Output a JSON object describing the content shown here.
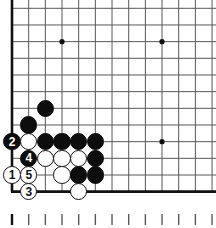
{
  "diagram": {
    "kind": "go-board-corner-diagram",
    "board": {
      "origin_x": 12,
      "origin_y": 8.3,
      "step": 16.67,
      "cols": 13,
      "rows": 12,
      "line_color": "#58585a",
      "edge_color": "#111111",
      "edge_width": 2.6,
      "line_width": 1.0,
      "background": "#ffffff",
      "edges": {
        "left": true,
        "bottom": true,
        "top": false,
        "right": false
      },
      "star_points": [
        {
          "col": 3,
          "row": 2
        },
        {
          "col": 9,
          "row": 2
        },
        {
          "col": 9,
          "row": 8
        }
      ],
      "star_radius": 2.6,
      "star_color": "#111111"
    },
    "stone_radius": 8.8,
    "stones": [
      {
        "id": "b-c2r6",
        "color": "black",
        "col": 2,
        "row": 6,
        "label": ""
      },
      {
        "id": "b-c1r7",
        "color": "black",
        "col": 1,
        "row": 7,
        "label": ""
      },
      {
        "id": "b-c0r8",
        "color": "black",
        "col": 0,
        "row": 8,
        "label": "2"
      },
      {
        "id": "w-c1r8",
        "color": "white",
        "col": 1,
        "row": 8,
        "label": ""
      },
      {
        "id": "b-c2r8",
        "color": "black",
        "col": 2,
        "row": 8,
        "label": ""
      },
      {
        "id": "b-c3r8",
        "color": "black",
        "col": 3,
        "row": 8,
        "label": ""
      },
      {
        "id": "b-c4r8",
        "color": "black",
        "col": 4,
        "row": 8,
        "label": ""
      },
      {
        "id": "b-c5r8",
        "color": "black",
        "col": 5,
        "row": 8,
        "label": ""
      },
      {
        "id": "b-c1r9",
        "color": "black",
        "col": 1,
        "row": 9,
        "label": "4"
      },
      {
        "id": "w-c2r9",
        "color": "white",
        "col": 2,
        "row": 9,
        "label": ""
      },
      {
        "id": "w-c3r9",
        "color": "white",
        "col": 3,
        "row": 9,
        "label": ""
      },
      {
        "id": "w-c4r9",
        "color": "white",
        "col": 4,
        "row": 9,
        "label": ""
      },
      {
        "id": "b-c5r9",
        "color": "black",
        "col": 5,
        "row": 9,
        "label": ""
      },
      {
        "id": "w-c0r10",
        "color": "white",
        "col": 0,
        "row": 10,
        "label": "1"
      },
      {
        "id": "w-c1r10",
        "color": "white",
        "col": 1,
        "row": 10,
        "label": "5"
      },
      {
        "id": "w-c3r10",
        "color": "white",
        "col": 3,
        "row": 10,
        "label": ""
      },
      {
        "id": "b-c4r10",
        "color": "black",
        "col": 4,
        "row": 10,
        "label": ""
      },
      {
        "id": "b-c5r10",
        "color": "black",
        "col": 5,
        "row": 10,
        "label": ""
      },
      {
        "id": "w-c1r11",
        "color": "white",
        "col": 1,
        "row": 11,
        "label": "3"
      },
      {
        "id": "w-c4r11",
        "color": "white",
        "col": 4,
        "row": 11,
        "label": ""
      }
    ],
    "ruler": {
      "tick_count": 13,
      "origin_x": 12,
      "step": 16.67,
      "top_y": 214,
      "height": 11,
      "color": "#58585a",
      "first_tick_color": "#111111",
      "width": 1.4,
      "first_tick_width": 2.4
    }
  }
}
